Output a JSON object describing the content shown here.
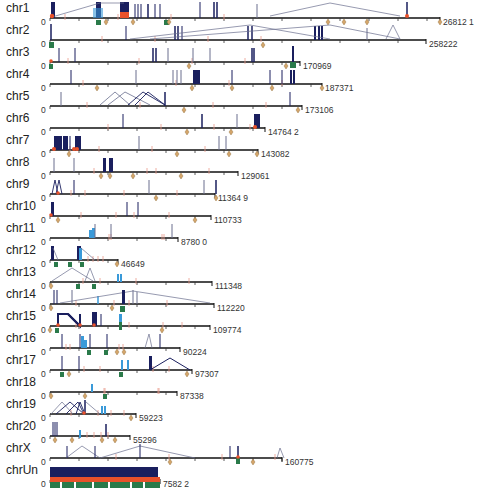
{
  "figure": {
    "type": "genome-wide chromosome track diagram",
    "axis_start_label": "0",
    "colors": {
      "axis": "#111111",
      "tick": "#333333",
      "navy_feature": "#1a1f5e",
      "red_marker": "#e8512a",
      "light_red_tick": "#e89a8a",
      "green_marker": "#2a7a4a",
      "blue_marker": "#3a9ad9",
      "diamond": "#d4a56a",
      "arc": "#6a6f8e"
    }
  },
  "chromosomes": [
    {
      "name": "chr1",
      "end_label": "26812 1",
      "y": 18,
      "x_end": 440
    },
    {
      "name": "chr2",
      "end_label": "258222",
      "y": 40,
      "x_end": 426
    },
    {
      "name": "chr3",
      "end_label": "170969",
      "y": 62,
      "x_end": 300
    },
    {
      "name": "chr4",
      "end_label": "187371",
      "y": 84,
      "x_end": 322
    },
    {
      "name": "chr5",
      "end_label": "173106",
      "y": 106,
      "x_end": 302
    },
    {
      "name": "chr6",
      "end_label": "14764 2",
      "y": 128,
      "x_end": 265
    },
    {
      "name": "chr7",
      "end_label": "143082",
      "y": 150,
      "x_end": 258
    },
    {
      "name": "chr8",
      "end_label": "129061",
      "y": 172,
      "x_end": 238
    },
    {
      "name": "chr9",
      "end_label": "11364 9",
      "y": 194,
      "x_end": 215
    },
    {
      "name": "chr10",
      "end_label": "110733",
      "y": 216,
      "x_end": 211
    },
    {
      "name": "chr11",
      "end_label": "8780 0",
      "y": 238,
      "x_end": 178
    },
    {
      "name": "chr12",
      "end_label": "46649",
      "y": 260,
      "x_end": 118
    },
    {
      "name": "chr13",
      "end_label": "111348",
      "y": 282,
      "x_end": 212
    },
    {
      "name": "chr14",
      "end_label": "112220",
      "y": 304,
      "x_end": 214
    },
    {
      "name": "chr15",
      "end_label": "109774",
      "y": 326,
      "x_end": 210
    },
    {
      "name": "chr16",
      "end_label": "90224",
      "y": 348,
      "x_end": 180
    },
    {
      "name": "chr17",
      "end_label": "97307",
      "y": 370,
      "x_end": 192
    },
    {
      "name": "chr18",
      "end_label": "87338",
      "y": 392,
      "x_end": 177
    },
    {
      "name": "chr19",
      "end_label": "59223",
      "y": 414,
      "x_end": 136
    },
    {
      "name": "chr20",
      "end_label": "55296",
      "y": 436,
      "x_end": 130
    },
    {
      "name": "chrX",
      "end_label": "160775",
      "y": 458,
      "x_end": 282
    },
    {
      "name": "chrUn",
      "end_label": "7582 2",
      "y": 480,
      "x_end": 160
    }
  ]
}
